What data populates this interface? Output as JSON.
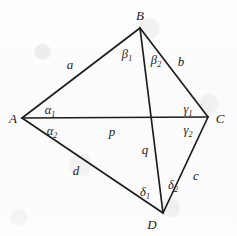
{
  "figure": {
    "kind": "geometry-diagram",
    "stroke_color": "#1d1d1d",
    "background_color": "#fdfdfd",
    "width": 237,
    "height": 236
  },
  "vertices": [
    {
      "id": "A",
      "label": "A",
      "x": 22,
      "y": 118,
      "label_x": 13,
      "label_y": 118
    },
    {
      "id": "B",
      "label": "B",
      "x": 140,
      "y": 28,
      "label_x": 140,
      "label_y": 15
    },
    {
      "id": "C",
      "label": "C",
      "x": 208,
      "y": 117,
      "label_x": 220,
      "label_y": 118
    },
    {
      "id": "D",
      "label": "D",
      "x": 163,
      "y": 213,
      "label_x": 152,
      "label_y": 224
    }
  ],
  "edges": [
    {
      "id": "AB",
      "from": "A",
      "to": "B",
      "label": "a",
      "label_x": 70,
      "label_y": 64
    },
    {
      "id": "BC",
      "from": "B",
      "to": "C",
      "label": "b",
      "label_x": 181,
      "label_y": 61
    },
    {
      "id": "CD",
      "from": "C",
      "to": "D",
      "label": "c",
      "label_x": 196,
      "label_y": 175
    },
    {
      "id": "DA",
      "from": "D",
      "to": "A",
      "label": "d",
      "label_x": 76,
      "label_y": 170
    }
  ],
  "diagonals": [
    {
      "id": "AC",
      "from": "A",
      "to": "C",
      "label": "p",
      "label_x": 112,
      "label_y": 131
    },
    {
      "id": "BD",
      "from": "B",
      "to": "D",
      "label": "q",
      "label_x": 145,
      "label_y": 149
    }
  ],
  "intersection": {
    "x": 153,
    "y": 118
  },
  "angles": [
    {
      "id": "alpha1",
      "vertex": "A",
      "greek": "α",
      "sub": "1",
      "x": 50,
      "y": 111
    },
    {
      "id": "alpha2",
      "vertex": "A",
      "greek": "α",
      "sub": "2",
      "x": 52,
      "y": 132
    },
    {
      "id": "beta1",
      "vertex": "B",
      "greek": "β",
      "sub": "1",
      "x": 127,
      "y": 55
    },
    {
      "id": "beta2",
      "vertex": "B",
      "greek": "β",
      "sub": "2",
      "x": 156,
      "y": 61
    },
    {
      "id": "gamma1",
      "vertex": "C",
      "greek": "γ",
      "sub": "1",
      "x": 188,
      "y": 110
    },
    {
      "id": "gamma2",
      "vertex": "C",
      "greek": "γ",
      "sub": "2",
      "x": 188,
      "y": 131
    },
    {
      "id": "delta1",
      "vertex": "D",
      "greek": "δ",
      "sub": "1",
      "x": 145,
      "y": 193
    },
    {
      "id": "delta2",
      "vertex": "D",
      "greek": "δ",
      "sub": "2",
      "x": 173,
      "y": 186
    }
  ]
}
